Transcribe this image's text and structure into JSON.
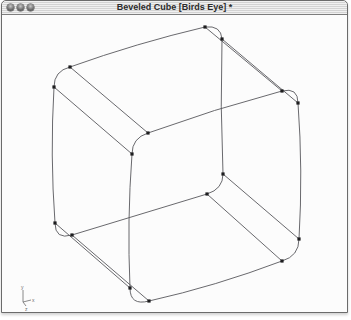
{
  "window": {
    "title": "Beveled Cube [Birds Eye] *",
    "buttons": [
      {
        "name": "close-button"
      },
      {
        "name": "minimize-button"
      },
      {
        "name": "zoom-button"
      }
    ]
  },
  "canvas": {
    "background": "#fcfcfc",
    "edge_color": "#58585c",
    "point_color": "#1d1d1f",
    "point_size": 3.2,
    "edge_width": 0.9
  },
  "wireframe": {
    "description": "beveled cube wireframe, birds-eye view, 16 control points",
    "points": {
      "A1": [
        204,
        26
      ],
      "A2": [
        221,
        38
      ],
      "B1": [
        69,
        66
      ],
      "B2": [
        53,
        86
      ],
      "C1": [
        147,
        132
      ],
      "C2": [
        131,
        153
      ],
      "D1": [
        281,
        90
      ],
      "D2": [
        297,
        102
      ],
      "E1": [
        222,
        173
      ],
      "E2": [
        206,
        193
      ],
      "F1": [
        54,
        222
      ],
      "F2": [
        71,
        234
      ],
      "G1": [
        129,
        287
      ],
      "G2": [
        148,
        300
      ],
      "H1": [
        298,
        238
      ],
      "H2": [
        281,
        260
      ]
    },
    "edges": [
      {
        "a": "B1",
        "b": "A1",
        "ctrl": [
          136,
          42
        ]
      },
      {
        "a": "A1",
        "b": "D1",
        "ctrl": null
      },
      {
        "a": "A2",
        "b": "D2",
        "ctrl": null
      },
      {
        "a": "D1",
        "b": "C1",
        "ctrl": [
          213,
          108
        ]
      },
      {
        "a": "B1",
        "b": "C1",
        "ctrl": null
      },
      {
        "a": "B2",
        "b": "C2",
        "ctrl": null
      },
      {
        "a": "B2",
        "b": "F1",
        "ctrl": [
          49,
          154
        ]
      },
      {
        "a": "C2",
        "b": "G1",
        "ctrl": [
          126,
          220
        ]
      },
      {
        "a": "F1",
        "b": "G1",
        "ctrl": null
      },
      {
        "a": "F2",
        "b": "G2",
        "ctrl": null
      },
      {
        "a": "A2",
        "b": "E1",
        "ctrl": [
          219,
          105
        ]
      },
      {
        "a": "D2",
        "b": "H1",
        "ctrl": [
          302,
          170
        ]
      },
      {
        "a": "E1",
        "b": "H1",
        "ctrl": null
      },
      {
        "a": "E2",
        "b": "H2",
        "ctrl": null
      },
      {
        "a": "F2",
        "b": "E2",
        "ctrl": null
      },
      {
        "a": "H2",
        "b": "G2",
        "ctrl": [
          215,
          285
        ]
      }
    ],
    "arcs": [
      {
        "a": "A1",
        "b": "A2",
        "ctrl": [
          220,
          24
        ]
      },
      {
        "a": "B1",
        "b": "B2",
        "ctrl": [
          53,
          70
        ]
      },
      {
        "a": "C1",
        "b": "C2",
        "ctrl": [
          131,
          137
        ]
      },
      {
        "a": "D1",
        "b": "D2",
        "ctrl": [
          297,
          86
        ]
      },
      {
        "a": "E1",
        "b": "E2",
        "ctrl": [
          222,
          188
        ]
      },
      {
        "a": "F1",
        "b": "F2",
        "ctrl": [
          54,
          239
        ]
      },
      {
        "a": "G1",
        "b": "G2",
        "ctrl": [
          129,
          305
        ]
      },
      {
        "a": "H1",
        "b": "H2",
        "ctrl": [
          298,
          255
        ]
      }
    ]
  },
  "axis_gizmo": {
    "color": "#6c6c6c",
    "origin": [
      22,
      301
    ],
    "axes": [
      {
        "label": "y",
        "to": [
          22,
          289
        ],
        "label_pos": [
          20,
          288
        ]
      },
      {
        "label": "x",
        "to": [
          30,
          299
        ],
        "label_pos": [
          31,
          301
        ]
      },
      {
        "label": "z",
        "to": [
          25,
          305
        ],
        "label_pos": [
          24,
          310
        ]
      }
    ]
  }
}
